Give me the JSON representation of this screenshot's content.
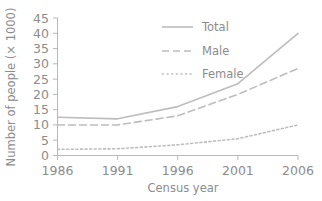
{
  "chart_data": {
    "type": "line",
    "title": "",
    "xlabel": "Census year",
    "ylabel": "Number of people (× 1000)",
    "x": [
      1986,
      1991,
      1996,
      2001,
      2006
    ],
    "categories": [
      "1986",
      "1991",
      "1996",
      "2001",
      "2006"
    ],
    "xtick_labels": [
      "1986",
      "1991",
      "1996",
      "2001",
      "2006"
    ],
    "ytick_labels": [
      "0",
      "5",
      "10",
      "15",
      "20",
      "25",
      "30",
      "35",
      "40",
      "45"
    ],
    "ytick_values": [
      0,
      5,
      10,
      15,
      20,
      25,
      30,
      35,
      40,
      45
    ],
    "xlim": [
      1986,
      2006
    ],
    "ylim": [
      0,
      45
    ],
    "grid": false,
    "legend_position": "top-center",
    "series": [
      {
        "name": "Total",
        "style": "solid",
        "color": "#bdbdbd",
        "values": [
          12.5,
          12.0,
          16.0,
          23.5,
          40.0
        ]
      },
      {
        "name": "Male",
        "style": "dashed",
        "color": "#bdbdbd",
        "values": [
          10.0,
          10.0,
          13.0,
          20.0,
          28.5
        ]
      },
      {
        "name": "Female",
        "style": "dotted",
        "color": "#bdbdbd",
        "values": [
          2.0,
          2.2,
          3.5,
          5.5,
          10.0
        ]
      }
    ]
  },
  "legend": {
    "items": [
      {
        "label": "Total"
      },
      {
        "label": "Male"
      },
      {
        "label": "Female"
      }
    ]
  }
}
